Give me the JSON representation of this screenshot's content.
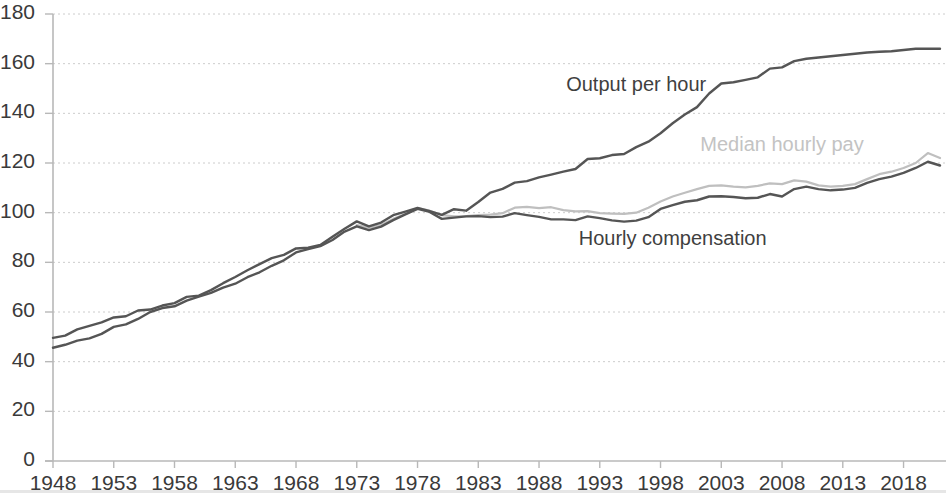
{
  "chart_data": {
    "type": "line",
    "title": "",
    "subtitle": "",
    "xlabel": "",
    "ylabel": "",
    "xlim": [
      1948,
      2021
    ],
    "ylim": [
      0,
      180
    ],
    "grid": true,
    "legend_position": "inline-annotations",
    "x_tick_labels": [
      "1948",
      "1953",
      "1958",
      "1963",
      "1968",
      "1973",
      "1978",
      "1983",
      "1988",
      "1993",
      "1998",
      "2003",
      "2008",
      "2013",
      "2018"
    ],
    "x_tick_values": [
      1948,
      1953,
      1958,
      1963,
      1968,
      1973,
      1978,
      1983,
      1988,
      1993,
      1998,
      2003,
      2008,
      2013,
      2018
    ],
    "y_tick_labels": [
      "0",
      "20",
      "40",
      "60",
      "80",
      "100",
      "120",
      "140",
      "160",
      "180"
    ],
    "y_tick_values": [
      0,
      20,
      40,
      60,
      80,
      100,
      120,
      140,
      160,
      180
    ],
    "colors": {
      "output_per_hour": "#555555",
      "hourly_compensation": "#555555",
      "median_hourly_pay": "#bfbfbf",
      "grid": "#cccccc",
      "axis": "#b8b8b8",
      "text": "#3a3a3a"
    },
    "annotations": [
      {
        "name": "output-per-hour-label",
        "text": "Output per hour",
        "x": 1996,
        "y": 151,
        "color": "#3f3f3f"
      },
      {
        "name": "median-hourly-pay-label",
        "text": "Median hourly pay",
        "x": 2008,
        "y": 127,
        "color": "#c3c3c3"
      },
      {
        "name": "hourly-compensation-label",
        "text": "Hourly compensation",
        "x": 1999,
        "y": 89,
        "color": "#3f3f3f"
      }
    ],
    "series": [
      {
        "name": "Output per hour",
        "color": "#555555",
        "x": [
          1948,
          1949,
          1950,
          1951,
          1952,
          1953,
          1954,
          1955,
          1956,
          1957,
          1958,
          1959,
          1960,
          1961,
          1962,
          1963,
          1964,
          1965,
          1966,
          1967,
          1968,
          1969,
          1970,
          1971,
          1972,
          1973,
          1974,
          1975,
          1976,
          1977,
          1978,
          1979,
          1980,
          1981,
          1982,
          1983,
          1984,
          1985,
          1986,
          1987,
          1988,
          1989,
          1990,
          1991,
          1992,
          1993,
          1994,
          1995,
          1996,
          1997,
          1998,
          1999,
          2000,
          2001,
          2002,
          2003,
          2004,
          2005,
          2006,
          2007,
          2008,
          2009,
          2010,
          2011,
          2012,
          2013,
          2014,
          2015,
          2016,
          2017,
          2018,
          2019,
          2020,
          2021
        ],
        "values": [
          49.6,
          50.5,
          53.0,
          54.4,
          55.8,
          57.8,
          58.3,
          60.6,
          61.0,
          62.6,
          63.6,
          66.1,
          66.6,
          68.8,
          71.6,
          74.1,
          76.8,
          79.3,
          81.7,
          83.0,
          85.6,
          85.9,
          87.0,
          90.3,
          93.5,
          96.5,
          94.5,
          96.0,
          99.0,
          100.4,
          101.9,
          100.6,
          99.1,
          101.4,
          100.8,
          104.3,
          108.1,
          109.6,
          112.1,
          112.7,
          114.2,
          115.3,
          116.5,
          117.6,
          121.6,
          121.9,
          123.2,
          123.6,
          126.4,
          128.6,
          132.0,
          136.0,
          139.5,
          142.5,
          148.0,
          152.0,
          156.0,
          158.5,
          159.5,
          161.0,
          161.5,
          166.0,
          172.0,
          172.5,
          173.5,
          174.5,
          175.5,
          177.0,
          177.5,
          178.5,
          180.5,
          183.0,
          189.0,
          191.0
        ],
        "values_plotted": [
          49.6,
          50.5,
          53.0,
          54.4,
          55.8,
          57.8,
          58.3,
          60.6,
          61.0,
          62.6,
          63.6,
          66.1,
          66.6,
          68.8,
          71.6,
          74.1,
          76.8,
          79.3,
          81.7,
          83.0,
          85.6,
          85.9,
          87.0,
          90.3,
          93.5,
          96.5,
          94.5,
          96.0,
          99.0,
          100.4,
          101.9,
          100.6,
          99.1,
          101.4,
          100.8,
          104.3,
          108.1,
          109.6,
          112.1,
          112.7,
          114.2,
          115.3,
          116.5,
          117.6,
          121.6,
          121.9,
          123.2,
          123.6,
          126.4,
          128.6,
          132.0,
          136.0,
          139.5,
          142.5,
          148.0,
          152.0,
          152.5,
          153.5,
          154.5,
          158.0,
          158.5,
          161.0,
          162.0,
          162.5,
          163.0,
          163.5,
          164.0,
          164.5,
          164.8,
          165.0,
          165.5,
          166.0,
          166.0,
          166.0
        ]
      },
      {
        "name": "Hourly compensation",
        "color": "#555555",
        "x": [
          1948,
          1949,
          1950,
          1951,
          1952,
          1953,
          1954,
          1955,
          1956,
          1957,
          1958,
          1959,
          1960,
          1961,
          1962,
          1963,
          1964,
          1965,
          1966,
          1967,
          1968,
          1969,
          1970,
          1971,
          1972,
          1973,
          1974,
          1975,
          1976,
          1977,
          1978,
          1979,
          1980,
          1981,
          1982,
          1983,
          1984,
          1985,
          1986,
          1987,
          1988,
          1989,
          1990,
          1991,
          1992,
          1993,
          1994,
          1995,
          1996,
          1997,
          1998,
          1999,
          2000,
          2001,
          2002,
          2003,
          2004,
          2005,
          2006,
          2007,
          2008,
          2009,
          2010,
          2011,
          2012,
          2013,
          2014,
          2015,
          2016,
          2017,
          2018,
          2019,
          2020,
          2021
        ],
        "values": [
          45.6,
          46.8,
          48.5,
          49.4,
          51.2,
          54.0,
          55.0,
          57.2,
          60.0,
          61.6,
          62.3,
          64.6,
          66.2,
          67.7,
          69.8,
          71.4,
          74.0,
          76.0,
          78.6,
          80.8,
          84.0,
          85.3,
          86.5,
          89.0,
          92.4,
          94.5,
          93.0,
          94.4,
          97.0,
          99.3,
          101.5,
          100.3,
          97.5,
          98.0,
          98.5,
          98.6,
          98.2,
          98.4,
          99.8,
          99.0,
          98.3,
          97.3,
          97.3,
          97.0,
          98.5,
          97.8,
          96.9,
          96.4,
          96.8,
          98.2,
          101.5,
          103.0,
          104.4,
          105.0,
          106.5,
          106.6,
          106.3,
          105.8,
          106.0,
          107.5,
          106.5,
          109.5,
          110.5,
          109.5,
          109.0,
          109.3,
          110.0,
          112.0,
          113.5,
          114.5,
          116.0,
          118.0,
          120.5,
          119.0
        ]
      },
      {
        "name": "Median hourly pay",
        "color": "#bfbfbf",
        "x": [
          1973,
          1974,
          1975,
          1976,
          1977,
          1978,
          1979,
          1980,
          1981,
          1982,
          1983,
          1984,
          1985,
          1986,
          1987,
          1988,
          1989,
          1990,
          1991,
          1992,
          1993,
          1994,
          1995,
          1996,
          1997,
          1998,
          1999,
          2000,
          2001,
          2002,
          2003,
          2004,
          2005,
          2006,
          2007,
          2008,
          2009,
          2010,
          2011,
          2012,
          2013,
          2014,
          2015,
          2016,
          2017,
          2018,
          2019,
          2020,
          2021
        ],
        "values": [
          95.0,
          94.0,
          95.0,
          97.5,
          99.5,
          101.8,
          100.8,
          99.0,
          98.5,
          98.6,
          99.0,
          99.2,
          99.8,
          102.0,
          102.3,
          101.8,
          102.2,
          101.0,
          100.5,
          100.6,
          99.8,
          99.6,
          99.5,
          100.0,
          102.0,
          104.5,
          106.5,
          108.0,
          109.5,
          110.8,
          111.0,
          110.5,
          110.2,
          110.8,
          111.8,
          111.5,
          113.0,
          112.5,
          111.0,
          110.5,
          110.8,
          111.5,
          113.5,
          115.5,
          116.5,
          118.0,
          120.0,
          124.0,
          122.0
        ]
      }
    ]
  },
  "axes": {
    "y_labels": [
      "180",
      "160",
      "140",
      "120",
      "100",
      "80",
      "60",
      "40",
      "20",
      "0"
    ],
    "x_labels": [
      "1948",
      "1953",
      "1958",
      "1963",
      "1968",
      "1973",
      "1978",
      "1983",
      "1988",
      "1993",
      "1998",
      "2003",
      "2008",
      "2013",
      "2018"
    ]
  },
  "labels": {
    "output_per_hour": "Output per hour",
    "median_hourly_pay": "Median hourly pay",
    "hourly_compensation": "Hourly compensation"
  }
}
